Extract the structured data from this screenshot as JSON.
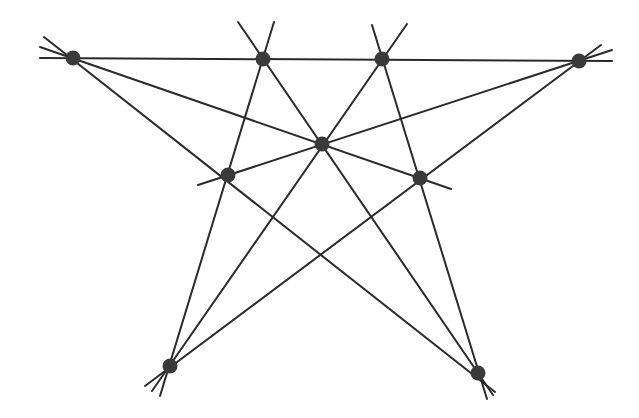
{
  "diagram": {
    "colors": {
      "line": "#2a2a2a",
      "point": "#3a3a3a",
      "background": "#ffffff"
    },
    "point_radius": 7.5,
    "points": [
      {
        "id": "A",
        "x": 73,
        "y": 58
      },
      {
        "id": "B",
        "x": 263,
        "y": 59
      },
      {
        "id": "C",
        "x": 382,
        "y": 59
      },
      {
        "id": "D",
        "x": 579,
        "y": 61
      },
      {
        "id": "E",
        "x": 322,
        "y": 144
      },
      {
        "id": "F",
        "x": 228,
        "y": 175
      },
      {
        "id": "G",
        "x": 420,
        "y": 178
      },
      {
        "id": "H",
        "x": 170,
        "y": 366
      },
      {
        "id": "I",
        "x": 478,
        "y": 373
      }
    ],
    "lines": [
      {
        "through": [
          "A",
          "B",
          "C",
          "D"
        ],
        "x1": 40,
        "y1": 58,
        "x2": 612,
        "y2": 61
      },
      {
        "through": [
          "A",
          "E",
          "G"
        ],
        "x1": 40,
        "y1": 47,
        "x2": 451,
        "y2": 189
      },
      {
        "through": [
          "D",
          "E",
          "F"
        ],
        "x1": 612,
        "y1": 50,
        "x2": 198,
        "y2": 185
      },
      {
        "through": [
          "A",
          "F",
          "I"
        ],
        "x1": 44,
        "y1": 37,
        "x2": 495,
        "y2": 392
      },
      {
        "through": [
          "D",
          "G",
          "H"
        ],
        "x1": 601,
        "y1": 45,
        "x2": 145,
        "y2": 386
      },
      {
        "through": [
          "B",
          "F",
          "H"
        ],
        "x1": 274,
        "y1": 22,
        "x2": 160,
        "y2": 396
      },
      {
        "through": [
          "C",
          "G",
          "I"
        ],
        "x1": 372,
        "y1": 25,
        "x2": 487,
        "y2": 399
      },
      {
        "through": [
          "B",
          "E",
          "I"
        ],
        "x1": 238,
        "y1": 22,
        "x2": 493,
        "y2": 395
      },
      {
        "through": [
          "C",
          "E",
          "H"
        ],
        "x1": 407,
        "y1": 24,
        "x2": 152,
        "y2": 391
      }
    ]
  }
}
